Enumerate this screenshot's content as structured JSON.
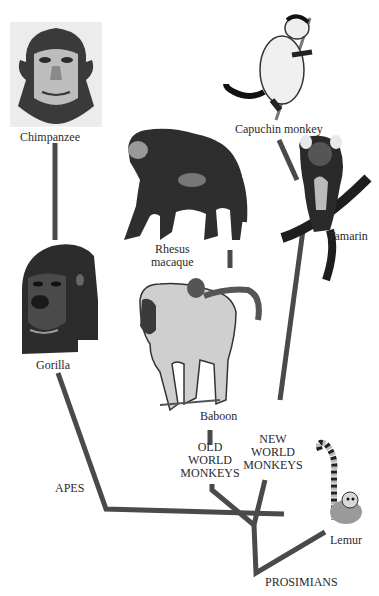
{
  "diagram": {
    "type": "phylogenetic-tree",
    "branch_color": "#4a4a4a",
    "species": [
      {
        "id": "chimpanzee",
        "label": "Chimpanzee"
      },
      {
        "id": "gorilla",
        "label": "Gorilla"
      },
      {
        "id": "rhesus",
        "label_line1": "Rhesus",
        "label_line2": "macaque"
      },
      {
        "id": "baboon",
        "label": "Baboon"
      },
      {
        "id": "capuchin",
        "label": "Capuchin monkey"
      },
      {
        "id": "tamarin",
        "label": "Tamarin"
      },
      {
        "id": "lemur",
        "label": "Lemur"
      }
    ],
    "groups": {
      "apes": "APES",
      "old_world": [
        "OLD",
        "WORLD",
        "MONKEYS"
      ],
      "new_world": [
        "NEW",
        "WORLD",
        "MONKEYS"
      ],
      "prosimians": "PROSIMIANS"
    }
  }
}
